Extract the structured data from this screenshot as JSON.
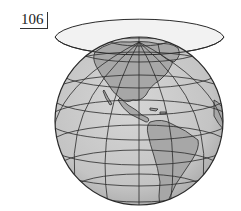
{
  "figure": {
    "number": "106",
    "colors": {
      "globe_fill": "#c8c8c8",
      "land_fill": "#a9a9a9",
      "horizon_plane_fill": "#f0f0f0",
      "line": "#2a2a2a"
    }
  }
}
